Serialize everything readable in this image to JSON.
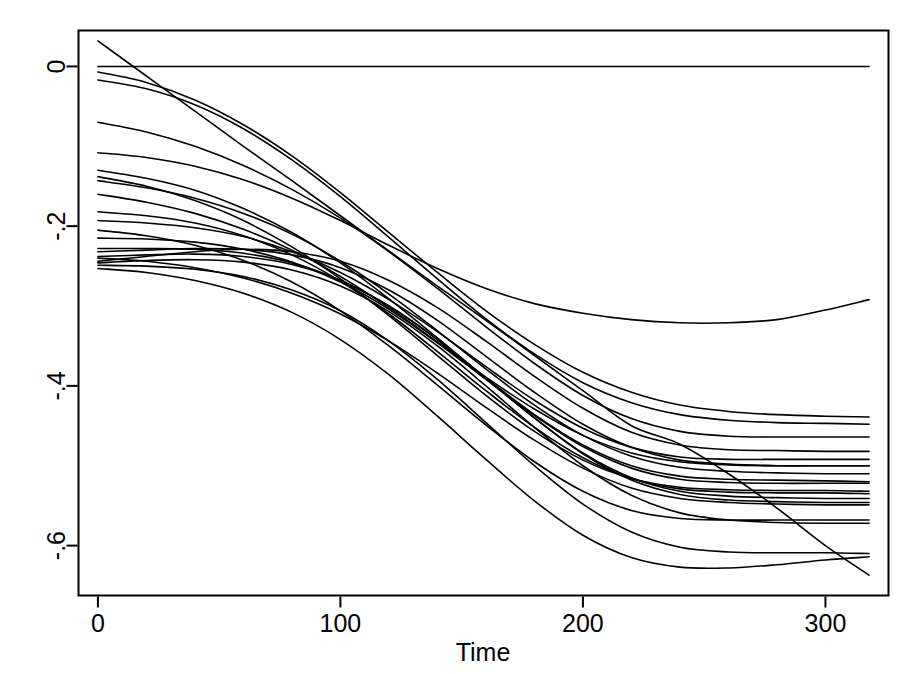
{
  "chart_data": {
    "type": "line",
    "title": "",
    "subtitle": "",
    "xlabel": "Time",
    "ylabel": "",
    "xlim": [
      -8,
      326
    ],
    "ylim": [
      -0.6625,
      0.045
    ],
    "grid": false,
    "legend": false,
    "legend_position": "none",
    "line_color": "#000000",
    "line_width": 1.6,
    "background_color": "#ffffff",
    "frame_color": "#000000",
    "x_ticks": [
      0,
      100,
      200,
      300
    ],
    "x_tick_labels": [
      "0",
      "100",
      "200",
      "300"
    ],
    "y_ticks": [
      0,
      -0.2,
      -0.4,
      -0.6
    ],
    "y_tick_labels": [
      "0",
      "-.2",
      "-.4",
      "-.6"
    ],
    "y_tick_label_rotation": -90,
    "x": [
      0,
      20,
      40,
      60,
      80,
      100,
      120,
      140,
      160,
      180,
      200,
      220,
      240,
      260,
      280,
      300,
      318
    ],
    "n_series": 22,
    "series": [
      {
        "name": "curve-01-zero-reference",
        "values": [
          0.0,
          0.0,
          0.0,
          0.0,
          0.0,
          0.0,
          0.0,
          0.0,
          0.0,
          0.0,
          0.0,
          0.0,
          0.0,
          0.0,
          0.0,
          0.0,
          0.0
        ]
      },
      {
        "name": "curve-02-steep-linear",
        "values": [
          0.032,
          -0.012,
          -0.056,
          -0.1,
          -0.143,
          -0.187,
          -0.231,
          -0.275,
          -0.318,
          -0.362,
          -0.406,
          -0.45,
          -0.473,
          -0.51,
          -0.553,
          -0.6,
          -0.637
        ]
      },
      {
        "name": "curve-03",
        "values": [
          -0.007,
          -0.02,
          -0.042,
          -0.073,
          -0.112,
          -0.158,
          -0.208,
          -0.258,
          -0.306,
          -0.348,
          -0.383,
          -0.408,
          -0.424,
          -0.432,
          -0.436,
          -0.438,
          -0.439
        ]
      },
      {
        "name": "curve-04",
        "values": [
          -0.017,
          -0.028,
          -0.048,
          -0.078,
          -0.117,
          -0.163,
          -0.214,
          -0.266,
          -0.316,
          -0.36,
          -0.396,
          -0.421,
          -0.436,
          -0.443,
          -0.446,
          -0.447,
          -0.448
        ]
      },
      {
        "name": "curve-05",
        "values": [
          -0.07,
          -0.082,
          -0.1,
          -0.124,
          -0.154,
          -0.19,
          -0.232,
          -0.278,
          -0.326,
          -0.372,
          -0.412,
          -0.441,
          -0.457,
          -0.463,
          -0.464,
          -0.464,
          -0.464
        ]
      },
      {
        "name": "curve-06",
        "values": [
          -0.13,
          -0.14,
          -0.155,
          -0.178,
          -0.208,
          -0.246,
          -0.291,
          -0.34,
          -0.39,
          -0.436,
          -0.474,
          -0.5,
          -0.513,
          -0.517,
          -0.518,
          -0.519,
          -0.52
        ]
      },
      {
        "name": "curve-07",
        "values": [
          -0.138,
          -0.15,
          -0.168,
          -0.193,
          -0.226,
          -0.266,
          -0.312,
          -0.362,
          -0.412,
          -0.457,
          -0.493,
          -0.516,
          -0.527,
          -0.53,
          -0.531,
          -0.531,
          -0.532
        ]
      },
      {
        "name": "curve-08",
        "values": [
          -0.143,
          -0.152,
          -0.165,
          -0.184,
          -0.21,
          -0.244,
          -0.285,
          -0.331,
          -0.379,
          -0.424,
          -0.462,
          -0.488,
          -0.502,
          -0.507,
          -0.509,
          -0.51,
          -0.51
        ]
      },
      {
        "name": "curve-09",
        "values": [
          -0.16,
          -0.17,
          -0.184,
          -0.204,
          -0.23,
          -0.263,
          -0.302,
          -0.345,
          -0.389,
          -0.429,
          -0.462,
          -0.484,
          -0.495,
          -0.499,
          -0.5,
          -0.5,
          -0.5
        ]
      },
      {
        "name": "curve-10",
        "values": [
          -0.182,
          -0.187,
          -0.196,
          -0.212,
          -0.236,
          -0.269,
          -0.31,
          -0.357,
          -0.406,
          -0.452,
          -0.49,
          -0.516,
          -0.529,
          -0.533,
          -0.534,
          -0.534,
          -0.535
        ]
      },
      {
        "name": "curve-11",
        "values": [
          -0.193,
          -0.196,
          -0.202,
          -0.213,
          -0.232,
          -0.258,
          -0.292,
          -0.332,
          -0.376,
          -0.418,
          -0.453,
          -0.477,
          -0.489,
          -0.492,
          -0.492,
          -0.492,
          -0.492
        ]
      },
      {
        "name": "curve-12",
        "values": [
          -0.205,
          -0.212,
          -0.224,
          -0.243,
          -0.27,
          -0.306,
          -0.35,
          -0.399,
          -0.449,
          -0.495,
          -0.532,
          -0.556,
          -0.566,
          -0.568,
          -0.568,
          -0.568,
          -0.568
        ]
      },
      {
        "name": "curve-13",
        "values": [
          -0.215,
          -0.216,
          -0.22,
          -0.229,
          -0.245,
          -0.27,
          -0.304,
          -0.346,
          -0.392,
          -0.437,
          -0.476,
          -0.503,
          -0.517,
          -0.521,
          -0.522,
          -0.522,
          -0.522
        ]
      },
      {
        "name": "curve-14",
        "values": [
          -0.228,
          -0.228,
          -0.229,
          -0.234,
          -0.246,
          -0.268,
          -0.3,
          -0.342,
          -0.391,
          -0.44,
          -0.485,
          -0.518,
          -0.536,
          -0.543,
          -0.545,
          -0.546,
          -0.546
        ]
      },
      {
        "name": "curve-15",
        "values": [
          -0.232,
          -0.23,
          -0.228,
          -0.229,
          -0.236,
          -0.252,
          -0.28,
          -0.318,
          -0.363,
          -0.408,
          -0.448,
          -0.477,
          -0.493,
          -0.498,
          -0.5,
          -0.5,
          -0.5
        ]
      },
      {
        "name": "curve-16",
        "values": [
          -0.238,
          -0.236,
          -0.235,
          -0.238,
          -0.248,
          -0.268,
          -0.3,
          -0.342,
          -0.391,
          -0.44,
          -0.484,
          -0.515,
          -0.532,
          -0.538,
          -0.54,
          -0.541,
          -0.541
        ]
      },
      {
        "name": "curve-17",
        "values": [
          -0.244,
          -0.238,
          -0.232,
          -0.229,
          -0.232,
          -0.244,
          -0.268,
          -0.302,
          -0.344,
          -0.388,
          -0.428,
          -0.458,
          -0.474,
          -0.48,
          -0.481,
          -0.482,
          -0.482
        ]
      },
      {
        "name": "curve-18",
        "values": [
          -0.246,
          -0.243,
          -0.242,
          -0.245,
          -0.255,
          -0.275,
          -0.307,
          -0.35,
          -0.4,
          -0.452,
          -0.5,
          -0.537,
          -0.559,
          -0.568,
          -0.571,
          -0.572,
          -0.572
        ]
      },
      {
        "name": "curve-19",
        "values": [
          -0.249,
          -0.25,
          -0.254,
          -0.263,
          -0.28,
          -0.306,
          -0.344,
          -0.392,
          -0.446,
          -0.5,
          -0.548,
          -0.583,
          -0.602,
          -0.608,
          -0.609,
          -0.609,
          -0.61
        ]
      },
      {
        "name": "curve-20",
        "values": [
          -0.253,
          -0.258,
          -0.268,
          -0.284,
          -0.308,
          -0.342,
          -0.386,
          -0.438,
          -0.492,
          -0.544,
          -0.587,
          -0.615,
          -0.627,
          -0.628,
          -0.624,
          -0.618,
          -0.614
        ]
      },
      {
        "name": "curve-21",
        "values": [
          -0.24,
          -0.244,
          -0.252,
          -0.265,
          -0.284,
          -0.31,
          -0.344,
          -0.384,
          -0.427,
          -0.468,
          -0.503,
          -0.528,
          -0.541,
          -0.546,
          -0.548,
          -0.549,
          -0.549
        ]
      },
      {
        "name": "curve-22-shallow-top",
        "values": [
          -0.108,
          -0.114,
          -0.125,
          -0.142,
          -0.165,
          -0.193,
          -0.224,
          -0.253,
          -0.278,
          -0.297,
          -0.309,
          -0.317,
          -0.321,
          -0.321,
          -0.317,
          -0.305,
          -0.292
        ]
      }
    ]
  },
  "axes": {
    "x_axis_title": "Time",
    "x_tick_labels": [
      "0",
      "100",
      "200",
      "300"
    ],
    "y_tick_labels": [
      "0",
      "-.2",
      "-.4",
      "-.6"
    ]
  }
}
